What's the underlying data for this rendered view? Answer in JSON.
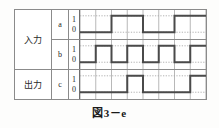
{
  "figure": {
    "caption": "図3－e",
    "frame_color": "#8b8b8b",
    "grid_color": "#9a9a9a",
    "dotted_color": "#a8a8a8",
    "wave_color": "#4a4a4a"
  },
  "groups": [
    {
      "label": "入力",
      "name": "input-group",
      "signals": [
        {
          "name": "a",
          "high_label": "1",
          "low_label": "0"
        },
        {
          "name": "b",
          "high_label": "1",
          "low_label": "0"
        }
      ]
    },
    {
      "label": "出力",
      "name": "output-group",
      "signals": [
        {
          "name": "c",
          "high_label": "1",
          "low_label": "0"
        }
      ]
    }
  ],
  "chart_data": {
    "type": "line",
    "title": "図3－e",
    "xlabel": "",
    "ylabel": "",
    "time_units": 8,
    "grid": true,
    "ylim": [
      0,
      1
    ],
    "ytick_labels": [
      "0",
      "1"
    ],
    "series": [
      {
        "name": "a",
        "role": "input",
        "values": [
          0,
          0,
          1,
          1,
          0,
          0,
          1,
          1
        ],
        "transitions": [
          {
            "t": 0,
            "level": 0
          },
          {
            "t": 2,
            "level": 1
          },
          {
            "t": 4,
            "level": 0
          },
          {
            "t": 6,
            "level": 1
          },
          {
            "t": 8,
            "level": 1
          }
        ]
      },
      {
        "name": "b",
        "role": "input",
        "values": [
          0,
          1,
          0,
          1,
          0,
          1,
          0,
          1
        ],
        "transitions": [
          {
            "t": 0,
            "level": 0
          },
          {
            "t": 1,
            "level": 1
          },
          {
            "t": 2,
            "level": 0
          },
          {
            "t": 3,
            "level": 1
          },
          {
            "t": 4,
            "level": 0
          },
          {
            "t": 5,
            "level": 1
          },
          {
            "t": 6,
            "level": 0
          },
          {
            "t": 7,
            "level": 1
          },
          {
            "t": 8,
            "level": 1
          }
        ]
      },
      {
        "name": "c",
        "role": "output",
        "values": [
          0,
          0,
          0,
          1,
          0,
          0,
          0,
          1
        ],
        "transitions": [
          {
            "t": 0,
            "level": 0
          },
          {
            "t": 3,
            "level": 1
          },
          {
            "t": 4,
            "level": 0
          },
          {
            "t": 7,
            "level": 1
          },
          {
            "t": 8,
            "level": 1
          }
        ]
      }
    ]
  }
}
